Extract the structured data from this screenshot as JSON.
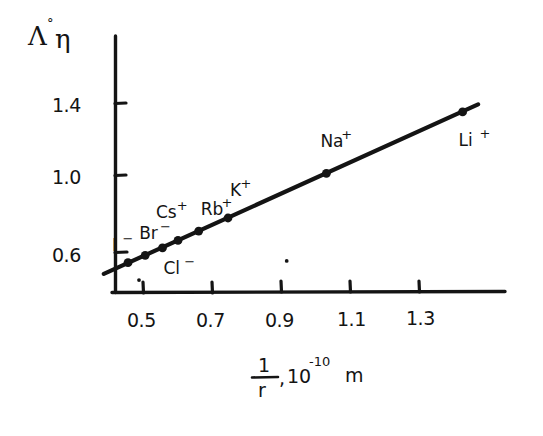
{
  "figure": {
    "caption": "",
    "ink_color": "#141414",
    "background_color": "#ffffff"
  },
  "chart_data": {
    "type": "scatter",
    "title": "",
    "subtitle": "",
    "xlabel": "1/r, 10⁻¹⁰ m",
    "xlabel_parts": {
      "numerator": "1",
      "denominator": "r",
      "comma": ",",
      "base": "10",
      "exponent": "-10",
      "unit": "m"
    },
    "ylabel": "Λ°η",
    "ylabel_parts": {
      "lambda": "Λ",
      "degree": "°",
      "eta": "η"
    },
    "xticks": [
      0.5,
      0.7,
      0.9,
      1.1,
      1.3
    ],
    "xtick_labels": [
      "0.5",
      "0.7",
      "0.9",
      "1.1",
      "1.3"
    ],
    "yticks": [
      0.6,
      1.0,
      1.4
    ],
    "ytick_labels": [
      "0.6",
      "1.0",
      "1.4"
    ],
    "xlim": [
      0.38,
      1.47
    ],
    "ylim": [
      0.42,
      1.62
    ],
    "grid": false,
    "legend": "none",
    "series": [
      {
        "name": "Walden product",
        "marker": "filled-circle",
        "line": "solid",
        "points": [
          {
            "label": "I",
            "charge": "−",
            "x": 0.455,
            "y": 0.545,
            "label_dx": -16,
            "label_dy": -12
          },
          {
            "label": "Br",
            "charge": "−",
            "x": 0.505,
            "y": 0.585,
            "label_dx": -6,
            "label_dy": -16
          },
          {
            "label": "Cl",
            "charge": "−",
            "x": 0.555,
            "y": 0.625,
            "label_dx": 1,
            "label_dy": 26
          },
          {
            "label": "Cs",
            "charge": "+",
            "x": 0.6,
            "y": 0.665,
            "label_dx": -22,
            "label_dy": -22
          },
          {
            "label": "Rb",
            "charge": "+",
            "x": 0.66,
            "y": 0.715,
            "label_dx": 2,
            "label_dy": -16
          },
          {
            "label": "K",
            "charge": "+",
            "x": 0.745,
            "y": 0.785,
            "label_dx": 2,
            "label_dy": -22
          },
          {
            "label": "Na",
            "charge": "+",
            "x": 1.03,
            "y": 1.025,
            "label_dx": -6,
            "label_dy": -26
          },
          {
            "label": "Li",
            "charge": "+",
            "x": 1.425,
            "y": 1.355,
            "label_dx": -4,
            "label_dy": 34
          }
        ]
      }
    ],
    "fit_line": {
      "x_start": 0.385,
      "y_start": 0.485,
      "x_end": 1.47,
      "y_end": 1.395,
      "style": "solid-thick"
    },
    "stray_marks": [
      {
        "x": 0.915,
        "y": 0.555
      },
      {
        "x": 0.487,
        "y": 0.452
      }
    ]
  }
}
